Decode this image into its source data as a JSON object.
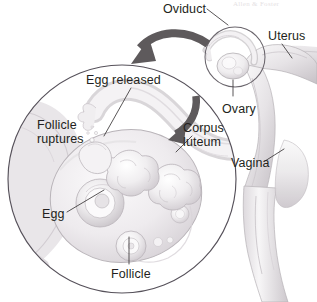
{
  "figure": {
    "width": 317,
    "height": 302,
    "background_color": "#ffffff",
    "ink_color": "#231f20",
    "tissue_light": "#f2f0f1",
    "tissue_mid": "#ddd9dc",
    "tissue_dark": "#c3bec2",
    "arrow_color": "#5e5a5c",
    "leader_color": "#3b3739",
    "circle_outline_color": "#56515a"
  },
  "credit": {
    "text": "Allen & Foster"
  },
  "labels": [
    {
      "id": "oviduct",
      "text": "Oviduct",
      "lines": [
        "Oviduct"
      ],
      "x": 163,
      "y": 3,
      "leader": "line-to-inset-top"
    },
    {
      "id": "uterus",
      "text": "Uterus",
      "lines": [
        "Uterus"
      ],
      "x": 268,
      "y": 30,
      "leader": "line-down-left"
    },
    {
      "id": "ovary",
      "text": "Ovary",
      "lines": [
        "Ovary"
      ],
      "x": 222,
      "y": 103,
      "leader": "vertical-line-up"
    },
    {
      "id": "vagina",
      "text": "Vagina",
      "lines": [
        "Vagina"
      ],
      "x": 231,
      "y": 157,
      "leader": "line-up-right"
    },
    {
      "id": "egg-released",
      "text": "Egg released",
      "lines": [
        "Egg released"
      ],
      "x": 86,
      "y": 74,
      "leader": "line-down-right"
    },
    {
      "id": "follicle-ruptures",
      "text": "Follicle ruptures",
      "lines": [
        "Follicle",
        "ruptures"
      ],
      "x": 37,
      "y": 119,
      "leader": "none"
    },
    {
      "id": "corpus-luteum",
      "text": "Corpus luteum",
      "lines": [
        "Corpus",
        "luteum"
      ],
      "x": 183,
      "y": 122,
      "leader": "line-down-left"
    },
    {
      "id": "egg",
      "text": "Egg",
      "lines": [
        "Egg"
      ],
      "x": 42,
      "y": 208,
      "leader": "line-up-right"
    },
    {
      "id": "follicle",
      "text": "Follicle",
      "lines": [
        "Follicle"
      ],
      "x": 111,
      "y": 268,
      "leader": "vertical-line-up"
    }
  ],
  "shapes": {
    "magnified_circle": {
      "cx": 122,
      "cy": 179,
      "r": 115
    },
    "inset_circle": {
      "cx": 235,
      "cy": 57,
      "r": 31
    },
    "magnify_arrow": "curved-arrow-from-inset-to-magnified-circle",
    "flow_arrow": "curved-arrow-inside-magnified-circle"
  }
}
